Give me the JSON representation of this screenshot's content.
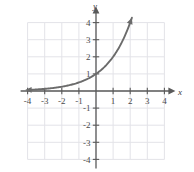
{
  "chart_data": {
    "type": "line",
    "title": "",
    "xlabel": "x",
    "ylabel": "y",
    "xlim": [
      -4,
      4
    ],
    "ylim": [
      -4,
      4
    ],
    "grid": true,
    "legend": "none",
    "x_ticks": [
      -4,
      -3,
      -2,
      -1,
      1,
      2,
      3,
      4
    ],
    "y_ticks": [
      4,
      3,
      2,
      1,
      -1,
      -2,
      -3,
      -4
    ],
    "x_tick_labels": [
      "-4",
      "-3",
      "-2",
      "-1",
      "1",
      "2",
      "3",
      "4"
    ],
    "y_tick_labels": [
      "4",
      "3",
      "2",
      "1",
      "-1",
      "-2",
      "-3",
      "-4"
    ],
    "series": [
      {
        "name": "exponential-curve",
        "equation": "y = 2^x",
        "color": "#6b6b6b",
        "arrow_start": true,
        "arrow_end": true,
        "x": [
          -4.0,
          -3.5,
          -3.0,
          -2.5,
          -2.0,
          -1.5,
          -1.0,
          -0.5,
          0.0,
          0.5,
          1.0,
          1.5,
          2.0,
          2.1
        ],
        "y": [
          0.0625,
          0.0884,
          0.125,
          0.1768,
          0.25,
          0.3536,
          0.5,
          0.7071,
          1.0,
          1.4142,
          2.0,
          2.8284,
          4.0,
          4.2871
        ]
      }
    ],
    "key_points": [
      {
        "x": 0,
        "y": 1
      },
      {
        "x": 1,
        "y": 2
      },
      {
        "x": 2,
        "y": 4
      }
    ]
  },
  "axis_labels": {
    "x": "x",
    "y": "y"
  },
  "colors": {
    "curve": "#6b6b6b",
    "axis": "#5a5a5a",
    "grid": "#e3e3e8",
    "tick_text": "#4a4a4a",
    "background": "#ffffff"
  }
}
